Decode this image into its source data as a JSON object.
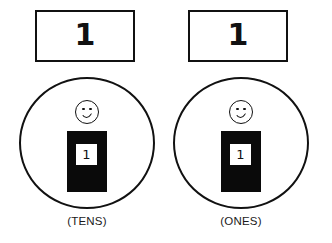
{
  "figure": {
    "background_color": "#ffffff",
    "ink_color": "#111111",
    "fill_color": "#0a0a0a"
  },
  "columns": [
    {
      "id": "tens",
      "digit_box_value": "1",
      "caption": "(TENS)",
      "figure_icons": {
        "head": "smiley-face-icon",
        "body": "black-torso-icon",
        "card": "digit-card-icon"
      },
      "card_value": "1"
    },
    {
      "id": "ones",
      "digit_box_value": "1",
      "caption": "(ONES)",
      "figure_icons": {
        "head": "smiley-face-icon",
        "body": "black-torso-icon",
        "card": "digit-card-icon"
      },
      "card_value": "1"
    }
  ]
}
